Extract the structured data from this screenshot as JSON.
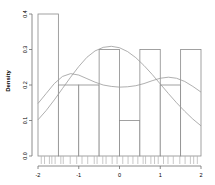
{
  "chart_data": {
    "type": "bar",
    "title": "",
    "subtitle": "",
    "xlabel": "",
    "ylabel": "Density",
    "xlim": [
      -2,
      2
    ],
    "ylim": [
      0,
      0.4
    ],
    "grid": false,
    "legend": "none",
    "bin_width": 0.5,
    "bin_edges": [
      -2,
      -1.5,
      -1,
      -0.5,
      0,
      0.5,
      1,
      1.5,
      2
    ],
    "categories": [
      "-2 to -1.5",
      "-1.5 to -1",
      "-1 to -0.5",
      "-0.5 to 0",
      "0 to 0.5",
      "0.5 to 1",
      "1 to 1.5",
      "1.5 to 2"
    ],
    "values": [
      0.4,
      0.2,
      0.2,
      0.3,
      0.1,
      0.3,
      0.2,
      0.3
    ],
    "xticks": [
      -2,
      -1,
      0,
      1,
      2
    ],
    "xticklabels": [
      "-2",
      "-1",
      "0",
      "1",
      "2"
    ],
    "yticks": [
      0.0,
      0.1,
      0.2,
      0.3,
      0.4
    ],
    "yticklabels": [
      "0.0",
      "0.1",
      "0.2",
      "0.3",
      "0.4"
    ],
    "series": [
      {
        "name": "kernel-density-curve",
        "type": "line",
        "x": [
          -2.0,
          -1.8,
          -1.6,
          -1.4,
          -1.2,
          -1.0,
          -0.8,
          -0.6,
          -0.4,
          -0.2,
          0.0,
          0.2,
          0.4,
          0.6,
          0.8,
          1.0,
          1.2,
          1.4,
          1.6,
          1.8,
          2.0
        ],
        "values": [
          0.148,
          0.176,
          0.204,
          0.224,
          0.232,
          0.228,
          0.218,
          0.208,
          0.2,
          0.196,
          0.194,
          0.195,
          0.198,
          0.204,
          0.212,
          0.219,
          0.222,
          0.219,
          0.21,
          0.196,
          0.18
        ]
      },
      {
        "name": "normal-density-curve",
        "type": "line",
        "x": [
          -2.0,
          -1.8,
          -1.6,
          -1.4,
          -1.2,
          -1.0,
          -0.8,
          -0.6,
          -0.4,
          -0.2,
          0.0,
          0.2,
          0.4,
          0.6,
          0.8,
          1.0,
          1.2,
          1.4,
          1.6,
          1.8,
          2.0
        ],
        "values": [
          0.102,
          0.128,
          0.158,
          0.19,
          0.222,
          0.252,
          0.278,
          0.296,
          0.306,
          0.309,
          0.305,
          0.294,
          0.277,
          0.255,
          0.23,
          0.203,
          0.176,
          0.15,
          0.126,
          0.104,
          0.085
        ]
      }
    ],
    "rug_values": [
      -1.92,
      -1.84,
      -1.72,
      -1.66,
      -1.58,
      -1.44,
      -1.38,
      -1.21,
      -1.05,
      -0.92,
      -0.78,
      -0.62,
      -0.55,
      -0.41,
      -0.33,
      -0.18,
      -0.06,
      0.08,
      0.21,
      0.33,
      0.45,
      0.58,
      0.64,
      0.77,
      0.86,
      0.95,
      1.08,
      1.19,
      1.32,
      1.48,
      1.61,
      1.74,
      1.82,
      1.91
    ],
    "colors": {
      "axis": "#6e6e6e",
      "bar_border": "#8a8a8a",
      "bar_fill": "#ffffff",
      "curve": "#9a9a9a",
      "rug": "#b0b0b0",
      "text": "#000000"
    }
  }
}
